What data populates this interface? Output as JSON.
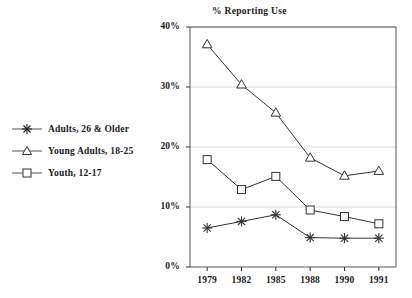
{
  "chart_data": {
    "type": "line",
    "title": "% Reporting Use",
    "xlabel": "",
    "ylabel": "",
    "categories": [
      "1979",
      "1982",
      "1985",
      "1988",
      "1990",
      "1991"
    ],
    "ylim": [
      0,
      40
    ],
    "yticks": [
      "0%",
      "10%",
      "20%",
      "30%",
      "40%"
    ],
    "ytick_values": [
      0,
      10,
      20,
      30,
      40
    ],
    "grid": true,
    "legend_position": "left-outside",
    "series": [
      {
        "name": "Adults, 26 & Older",
        "marker": "asterisk",
        "color": "#333333",
        "values": [
          6.5,
          7.6,
          8.7,
          4.9,
          4.8,
          4.8
        ]
      },
      {
        "name": "Young Adults, 18-25",
        "marker": "triangle",
        "color": "#333333",
        "values": [
          37.1,
          30.4,
          25.7,
          18.2,
          15.2,
          16.0
        ]
      },
      {
        "name": "Youth, 12-17",
        "marker": "square",
        "color": "#333333",
        "values": [
          17.9,
          12.9,
          15.1,
          9.5,
          8.4,
          7.2
        ]
      }
    ]
  },
  "legend": {
    "items": [
      {
        "label": "Adults, 26 & Older",
        "marker": "asterisk-marker-icon"
      },
      {
        "label": "Young Adults, 18-25",
        "marker": "triangle-marker-icon"
      },
      {
        "label": "Youth, 12-17",
        "marker": "square-marker-icon"
      }
    ]
  }
}
